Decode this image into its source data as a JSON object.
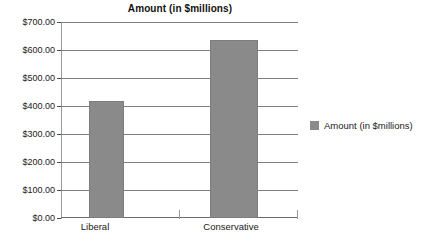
{
  "chart_data": {
    "type": "bar",
    "title": "Amount (in $millions)",
    "categories": [
      "Liberal",
      "Conservative"
    ],
    "values": [
      420,
      640
    ],
    "series": [
      {
        "name": "Amount (in $millions)",
        "values": [
          420,
          640
        ],
        "color": "#8a8a8a"
      }
    ],
    "xlabel": "",
    "ylabel": "",
    "ylim": [
      0,
      700
    ],
    "ytick_values": [
      0,
      100,
      200,
      300,
      400,
      500,
      600,
      700
    ],
    "ytick_labels": [
      "$0.00",
      "$100.00",
      "$200.00",
      "$300.00",
      "$400.00",
      "$500.00",
      "$600.00",
      "$700.00"
    ],
    "grid": true,
    "grid_axis": "y",
    "legend": {
      "position": "right",
      "entries": [
        {
          "label": "Amount (in $millions)",
          "color": "#8a8a8a"
        }
      ]
    },
    "colors": {
      "bar": "#8a8a8a",
      "bar_border": "#7d7d7d",
      "gridline": "#808080",
      "axis": "#9a9a9a",
      "text": "#1a1a1a",
      "background": "#ffffff"
    }
  }
}
